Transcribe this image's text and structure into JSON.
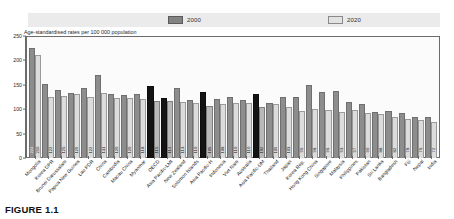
{
  "figure": {
    "caption": "FIGURE 1.1"
  },
  "legend": {
    "position": "top",
    "items": [
      {
        "label": "2000",
        "color": "#8d8d8d",
        "key": "y2000"
      },
      {
        "label": "2020",
        "color": "#dcdcdc",
        "key": "y2020"
      }
    ]
  },
  "axis": {
    "ylabel": "Age-standardised rates per 100 000 population",
    "ticks": [
      "250",
      "200",
      "150",
      "100",
      "50",
      "0"
    ]
  },
  "chart_data": {
    "type": "bar",
    "title": "",
    "subtitle": "",
    "xlabel": "",
    "ylabel": "Age-standardised rates per 100 000 population",
    "ylim": [
      0,
      250
    ],
    "yticks": [
      0,
      50,
      100,
      150,
      200,
      250
    ],
    "grid": false,
    "legend_position": "top",
    "categories": [
      "Mongolia",
      "Korea DPR",
      "Brunei Darussalam",
      "Papua New Guinea",
      "Lao PDR",
      "China",
      "Cambodia",
      "Macau China",
      "Myanmar",
      "OECD",
      "Asia Pacific-LMI",
      "New Zealand",
      "Solomon Islands",
      "Asia Pacific-H",
      "Indonesia",
      "Viet Nam",
      "Australia",
      "Asia Pacific-UM",
      "Thailand",
      "Japan",
      "Korea Rep.",
      "Hong Kong China",
      "Singapore",
      "Malaysia",
      "Philippines",
      "Pakistan",
      "Sri Lanka",
      "Bangladesh",
      "Fiji",
      "Nepal",
      "India"
    ],
    "highlighted_categories": [
      "OECD",
      "Asia Pacific-LMI",
      "Asia Pacific-H",
      "Asia Pacific-UM"
    ],
    "series": [
      {
        "name": "2000",
        "color": "#8d8d8d",
        "values": [
          224,
          150,
          138,
          131,
          141,
          168,
          130,
          127,
          129,
          145,
          121,
          141,
          116,
          133,
          118,
          123,
          116,
          129,
          110,
          123,
          122,
          147,
          134,
          135,
          112,
          109,
          92,
          95,
          90,
          83,
          81
        ]
      },
      {
        "name": "2020",
        "color": "#dcdcdc",
        "values": [
          210,
          122,
          125,
          129,
          122,
          131,
          120,
          120,
          118,
          115,
          114,
          113,
          110,
          105,
          108,
          110,
          110,
          102,
          109,
          103,
          95,
          98,
          96,
          93,
          97,
          90,
          88,
          82,
          78,
          76,
          72
        ]
      }
    ],
    "value_labels_2000": [
      "224",
      "",
      "",
      "",
      "",
      "",
      "",
      "",
      "",
      "",
      "",
      "",
      "",
      "",
      "",
      "",
      "",
      "",
      "",
      "",
      "",
      "",
      "",
      "",
      "",
      "",
      "",
      "",
      "",
      "",
      ""
    ],
    "value_labels_2020": [
      "210",
      "122",
      "125",
      "129",
      "122",
      "131",
      "120",
      "120",
      "118",
      "115",
      "114",
      "113",
      "110",
      "105",
      "108",
      "110",
      "110",
      "102",
      "109",
      "103",
      "95",
      "98",
      "96",
      "93",
      "97",
      "90",
      "88",
      "82",
      "78",
      "76",
      "72"
    ]
  }
}
